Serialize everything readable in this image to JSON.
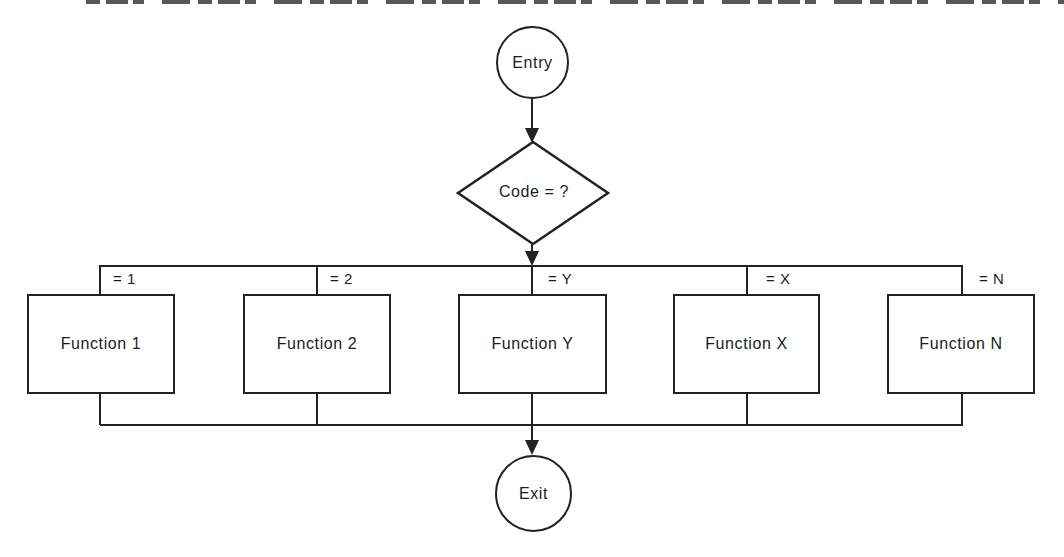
{
  "flowchart": {
    "entry_label": "Entry",
    "decision_label": "Code = ?",
    "exit_label": "Exit",
    "branches": [
      {
        "condition": "= 1",
        "function": "Function 1"
      },
      {
        "condition": "= 2",
        "function": "Function 2"
      },
      {
        "condition": "= Y",
        "function": "Function Y"
      },
      {
        "condition": "= X",
        "function": "Function X"
      },
      {
        "condition": "= N",
        "function": "Function N"
      }
    ],
    "colors": {
      "line": "#222222",
      "text": "#1c1c1c",
      "background": "#ffffff"
    }
  }
}
